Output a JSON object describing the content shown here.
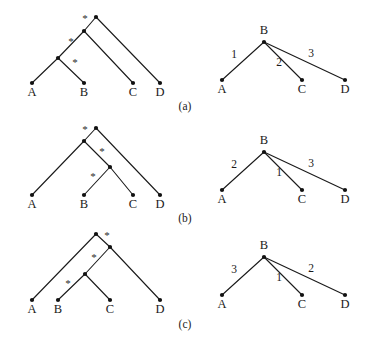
{
  "figure": {
    "width": 370,
    "height": 350,
    "background": "#ffffff",
    "ink_color": "#1a1a1a"
  },
  "panels": [
    {
      "id": "panel-a",
      "caption": "(a)",
      "caption_pos": {
        "x": 185,
        "y": 110
      },
      "left_tree": {
        "kind": "binary-tree-with-star-marks",
        "nodes": [
          {
            "id": "a-root",
            "x": 96,
            "y": 17,
            "label": "",
            "type": "internal"
          },
          {
            "id": "a-in1",
            "x": 84,
            "y": 31,
            "label": "",
            "type": "internal"
          },
          {
            "id": "a-in2",
            "x": 58,
            "y": 58,
            "label": "",
            "type": "internal"
          },
          {
            "id": "a-leafA",
            "x": 32,
            "y": 83,
            "label": "A",
            "type": "leaf"
          },
          {
            "id": "a-leafB",
            "x": 84,
            "y": 83,
            "label": "B",
            "type": "leaf"
          },
          {
            "id": "a-leafC",
            "x": 133,
            "y": 83,
            "label": "C",
            "type": "leaf"
          },
          {
            "id": "a-leafD",
            "x": 160,
            "y": 83,
            "label": "D",
            "type": "leaf"
          }
        ],
        "edges": [
          {
            "from": "a-root",
            "to": "a-in1"
          },
          {
            "from": "a-root",
            "to": "a-leafD"
          },
          {
            "from": "a-in1",
            "to": "a-in2"
          },
          {
            "from": "a-in1",
            "to": "a-leafC"
          },
          {
            "from": "a-in2",
            "to": "a-leafA"
          },
          {
            "from": "a-in2",
            "to": "a-leafB"
          }
        ],
        "stars": [
          {
            "text": "*",
            "x": 85,
            "y": 22
          },
          {
            "text": "*",
            "x": 71,
            "y": 45
          },
          {
            "text": "*",
            "x": 75,
            "y": 66
          }
        ]
      },
      "right_tree": {
        "kind": "star-tree-weighted",
        "center": {
          "id": "ar-B",
          "x": 264,
          "y": 42,
          "label": "B",
          "label_pos": {
            "x": 264,
            "y": 34
          }
        },
        "leaves": [
          {
            "id": "ar-A",
            "x": 222,
            "y": 80,
            "label": "A"
          },
          {
            "id": "ar-C",
            "x": 302,
            "y": 80,
            "label": "C"
          },
          {
            "id": "ar-D",
            "x": 345,
            "y": 80,
            "label": "D"
          }
        ],
        "edge_weights": [
          {
            "to": "ar-A",
            "value": "1",
            "x": 234,
            "y": 58
          },
          {
            "to": "ar-C",
            "value": "2",
            "x": 279,
            "y": 66
          },
          {
            "to": "ar-D",
            "value": "3",
            "x": 311,
            "y": 57
          }
        ]
      }
    },
    {
      "id": "panel-b",
      "caption": "(b)",
      "caption_pos": {
        "x": 185,
        "y": 222
      },
      "left_tree": {
        "kind": "binary-tree-with-star-marks",
        "nodes": [
          {
            "id": "b-root",
            "x": 96,
            "y": 128,
            "label": "",
            "type": "internal"
          },
          {
            "id": "b-in1",
            "x": 84,
            "y": 141,
            "label": "",
            "type": "internal"
          },
          {
            "id": "b-in2",
            "x": 110,
            "y": 167,
            "label": "",
            "type": "internal"
          },
          {
            "id": "b-leafA",
            "x": 32,
            "y": 195,
            "label": "A",
            "type": "leaf"
          },
          {
            "id": "b-leafB",
            "x": 84,
            "y": 195,
            "label": "B",
            "type": "leaf"
          },
          {
            "id": "b-leafC",
            "x": 133,
            "y": 195,
            "label": "C",
            "type": "leaf"
          },
          {
            "id": "b-leafD",
            "x": 160,
            "y": 195,
            "label": "D",
            "type": "leaf"
          }
        ],
        "edges": [
          {
            "from": "b-root",
            "to": "b-in1"
          },
          {
            "from": "b-root",
            "to": "b-leafD"
          },
          {
            "from": "b-in1",
            "to": "b-leafA"
          },
          {
            "from": "b-in1",
            "to": "b-in2"
          },
          {
            "from": "b-in2",
            "to": "b-leafB"
          },
          {
            "from": "b-in2",
            "to": "b-leafC"
          }
        ],
        "stars": [
          {
            "text": "*",
            "x": 85,
            "y": 133
          },
          {
            "text": "*",
            "x": 102,
            "y": 155
          },
          {
            "text": "*",
            "x": 93,
            "y": 180
          }
        ]
      },
      "right_tree": {
        "kind": "star-tree-weighted",
        "center": {
          "id": "br-B",
          "x": 264,
          "y": 152,
          "label": "B",
          "label_pos": {
            "x": 264,
            "y": 144
          }
        },
        "leaves": [
          {
            "id": "br-A",
            "x": 222,
            "y": 190,
            "label": "A"
          },
          {
            "id": "br-C",
            "x": 302,
            "y": 190,
            "label": "C"
          },
          {
            "id": "br-D",
            "x": 345,
            "y": 190,
            "label": "D"
          }
        ],
        "edge_weights": [
          {
            "to": "br-A",
            "value": "2",
            "x": 234,
            "y": 168
          },
          {
            "to": "br-C",
            "value": "1",
            "x": 279,
            "y": 176
          },
          {
            "to": "br-D",
            "value": "3",
            "x": 311,
            "y": 167
          }
        ]
      }
    },
    {
      "id": "panel-c",
      "caption": "(c)",
      "caption_pos": {
        "x": 185,
        "y": 328
      },
      "left_tree": {
        "kind": "binary-tree-with-star-marks",
        "nodes": [
          {
            "id": "c-root",
            "x": 96,
            "y": 234,
            "label": "",
            "type": "internal"
          },
          {
            "id": "c-in1",
            "x": 110,
            "y": 247,
            "label": "",
            "type": "internal"
          },
          {
            "id": "c-in2",
            "x": 85,
            "y": 274,
            "label": "",
            "type": "internal"
          },
          {
            "id": "c-leafA",
            "x": 32,
            "y": 300,
            "label": "A",
            "type": "leaf"
          },
          {
            "id": "c-leafB",
            "x": 58,
            "y": 300,
            "label": "B",
            "type": "leaf"
          },
          {
            "id": "c-leafC",
            "x": 110,
            "y": 300,
            "label": "C",
            "type": "leaf"
          },
          {
            "id": "c-leafD",
            "x": 160,
            "y": 300,
            "label": "D",
            "type": "leaf"
          }
        ],
        "edges": [
          {
            "from": "c-root",
            "to": "c-leafA"
          },
          {
            "from": "c-root",
            "to": "c-in1"
          },
          {
            "from": "c-in1",
            "to": "c-in2"
          },
          {
            "from": "c-in1",
            "to": "c-leafD"
          },
          {
            "from": "c-in2",
            "to": "c-leafB"
          },
          {
            "from": "c-in2",
            "to": "c-leafC"
          }
        ],
        "stars": [
          {
            "text": "*",
            "x": 107,
            "y": 239
          },
          {
            "text": "*",
            "x": 94,
            "y": 261
          },
          {
            "text": "*",
            "x": 68,
            "y": 287
          }
        ]
      },
      "right_tree": {
        "kind": "star-tree-weighted",
        "center": {
          "id": "cr-B",
          "x": 264,
          "y": 257,
          "label": "B",
          "label_pos": {
            "x": 264,
            "y": 249
          }
        },
        "leaves": [
          {
            "id": "cr-A",
            "x": 222,
            "y": 295,
            "label": "A"
          },
          {
            "id": "cr-C",
            "x": 302,
            "y": 295,
            "label": "C"
          },
          {
            "id": "cr-D",
            "x": 345,
            "y": 295,
            "label": "D"
          }
        ],
        "edge_weights": [
          {
            "to": "cr-A",
            "value": "3",
            "x": 234,
            "y": 273
          },
          {
            "to": "cr-C",
            "value": "1",
            "x": 279,
            "y": 281
          },
          {
            "to": "cr-D",
            "value": "2",
            "x": 311,
            "y": 272
          }
        ]
      }
    }
  ]
}
